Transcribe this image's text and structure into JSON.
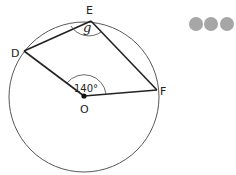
{
  "diagram": {
    "points": {
      "D": "D",
      "E": "E",
      "F": "F",
      "O": "O"
    },
    "angle_at_centre": "140°",
    "angle_at_circumference": "g",
    "segments": [
      "DE",
      "EF",
      "DO",
      "OF"
    ],
    "colors": {
      "line": "#222222",
      "dots": "#a6a6a6"
    }
  },
  "decoration": {
    "dots": [
      "dot-1",
      "dot-2",
      "dot-3"
    ]
  }
}
